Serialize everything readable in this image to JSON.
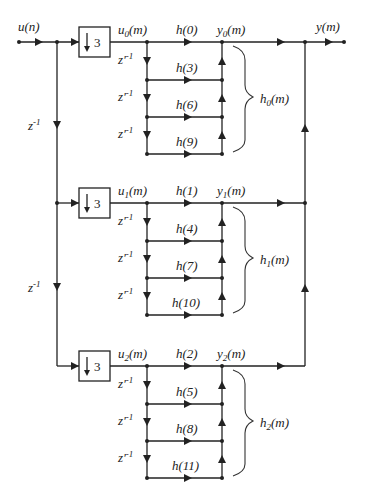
{
  "diagram": {
    "input": {
      "label": "u(n)",
      "base": "u",
      "arg": "n"
    },
    "output": {
      "label": "y(m)",
      "base": "y",
      "arg": "m"
    },
    "delay_label": "z-1",
    "decimator_label": "3",
    "branch_delay_label": "z'-1",
    "branches": [
      {
        "index": "0",
        "u_label": "u",
        "y_label": "y",
        "h_label": "h",
        "arg": "m",
        "taps": [
          "h(0)",
          "h(3)",
          "h(6)",
          "h(9)"
        ]
      },
      {
        "index": "1",
        "u_label": "u",
        "y_label": "y",
        "h_label": "h",
        "arg": "m",
        "taps": [
          "h(1)",
          "h(4)",
          "h(7)",
          "h(10)"
        ]
      },
      {
        "index": "2",
        "u_label": "u",
        "y_label": "y",
        "h_label": "h",
        "arg": "m",
        "taps": [
          "h(2)",
          "h(5)",
          "h(8)",
          "h(11)"
        ]
      }
    ]
  }
}
